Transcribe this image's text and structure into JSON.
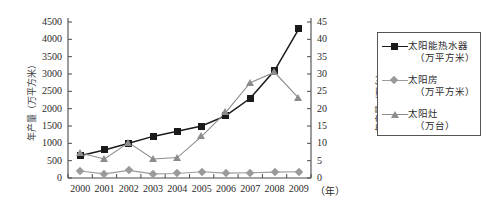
{
  "chart_data": {
    "type": "line",
    "title": "",
    "xlabel": "（年）",
    "x": [
      2000,
      2001,
      2002,
      2003,
      2004,
      2005,
      2006,
      2007,
      2008,
      2009
    ],
    "xtick_labels": [
      "2000",
      "2001",
      "2002",
      "2003",
      "2004",
      "2005",
      "2006",
      "2007",
      "2008",
      "2009"
    ],
    "grid": false,
    "legend_position": "right",
    "axes": {
      "left": {
        "label": "年产量（万平方米）",
        "label_main": "年产量",
        "label_unit": "（万平方米）",
        "min": 0,
        "max": 4500,
        "step": 500,
        "ticks": [
          "4500",
          "4000",
          "3500",
          "3000",
          "2500",
          "2000",
          "1500",
          "1000",
          "500",
          "0"
        ],
        "tick_values": [
          4500,
          4000,
          3500,
          3000,
          2500,
          2000,
          1500,
          1000,
          500,
          0
        ]
      },
      "right": {
        "label": "年产量（万台）",
        "label_main": "年产量",
        "label_unit": "（万台）",
        "min": 0,
        "max": 45,
        "step": 5,
        "ticks": [
          "45",
          "40",
          "35",
          "30",
          "25",
          "20",
          "15",
          "10",
          "5",
          "0"
        ],
        "tick_values": [
          45,
          40,
          35,
          30,
          25,
          20,
          15,
          10,
          5,
          0
        ]
      }
    },
    "series": [
      {
        "name": "太阳能热水器",
        "unit": "（万平方米）",
        "legend_label": "太阳能热水器",
        "legend_unit": "（万平方米）",
        "axis": "left",
        "marker": "square",
        "color": "#1a1a1a",
        "values": [
          640,
          810,
          1000,
          1200,
          1350,
          1500,
          1800,
          2300,
          3100,
          4300
        ]
      },
      {
        "name": "太阳房",
        "unit": "（万平方米）",
        "legend_label": "太阳房",
        "legend_unit": "（万平方米）",
        "axis": "left",
        "marker": "diamond",
        "color": "#9a9a9a",
        "values": [
          200,
          120,
          220,
          120,
          130,
          180,
          140,
          150,
          170,
          180
        ]
      },
      {
        "name": "太阳灶",
        "unit": "（万台）",
        "legend_label": "太阳灶",
        "legend_unit": "（万台）",
        "axis": "right",
        "marker": "triangle",
        "color": "#8c8c8c",
        "values": [
          7.2,
          5.5,
          10.2,
          5.5,
          5.9,
          12.0,
          19.0,
          27.5,
          30.5,
          23.0
        ]
      }
    ]
  }
}
